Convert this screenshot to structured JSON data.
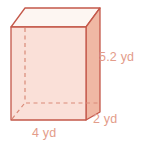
{
  "figure": {
    "name": "rectangular prism",
    "shape_type": "rectangular-prism",
    "colors": {
      "stroke": "#c4584a",
      "front_face_fill": "#fae0d8",
      "right_face_fill": "#f0b8a4",
      "top_face_fill": "#fdf6f2",
      "hidden_edge": "#d98a78",
      "label_text": "#e39c8a",
      "background": "#ffffff"
    },
    "labels": {
      "height": "5.2 yd",
      "width": "4 yd",
      "depth": "2 yd"
    },
    "dimensions": [
      {
        "name": "height",
        "value": 5.2,
        "unit": "yd",
        "text": "5.2 yd"
      },
      {
        "name": "width",
        "value": 4,
        "unit": "yd",
        "text": "4 yd"
      },
      {
        "name": "depth",
        "value": 2,
        "unit": "yd",
        "text": "2 yd"
      }
    ]
  }
}
